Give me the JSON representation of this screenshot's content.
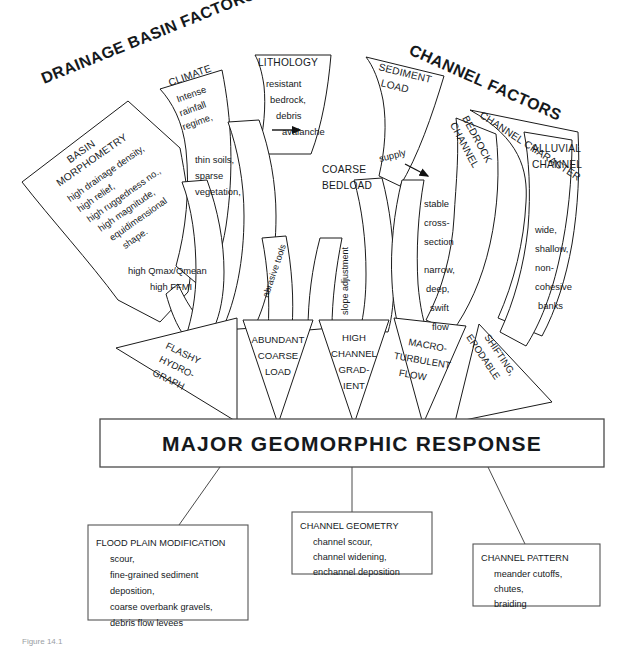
{
  "figure": {
    "caption": "Figure 14.1",
    "main_response_label": "MAJOR  GEOMORPHIC  RESPONSE"
  },
  "banners": [
    {
      "id": "drainage",
      "label": "DRAINAGE BASIN FACTORS"
    },
    {
      "id": "channel",
      "label": "CHANNEL FACTORS"
    }
  ],
  "factor_panels": [
    {
      "id": "basin-morphometry",
      "title_lines": [
        "BASIN",
        "MORPHOMETRY"
      ],
      "body_lines": [
        "high drainage density,",
        "high relief,",
        "high ruggedness no.,",
        "high magnitude,",
        "equidimensional",
        "shape."
      ],
      "output_lines": [
        "high Qmax/Qmean",
        "high FFMI"
      ]
    },
    {
      "id": "climate",
      "title_lines": [
        "CLIMATE"
      ],
      "body_lines": [
        "Intense",
        "rainfall",
        "regime,"
      ],
      "output_lines": [
        "thin soils,",
        "sparse",
        "vegetation,"
      ]
    },
    {
      "id": "lithology",
      "title_lines": [
        "LITHOLOGY"
      ],
      "body_lines": [
        "resistant",
        "bedrock,",
        "debris",
        "avalanche"
      ],
      "output_lines": [
        "COARSE",
        "BEDLOAD"
      ]
    },
    {
      "id": "sediment-load",
      "title_lines": [
        "SEDIMENT",
        "LOAD"
      ],
      "body_lines": [],
      "output_lines": [
        "supply"
      ]
    },
    {
      "id": "channel-character",
      "title_lines": [
        "CHANNEL CHARACTER"
      ],
      "body_lines": [],
      "output_lines": []
    },
    {
      "id": "bedrock-channel",
      "title_lines": [
        "BEDROCK",
        "CHANNEL"
      ],
      "body_lines": [
        "stable",
        "cross-",
        "section"
      ],
      "output_lines": [
        "narrow,",
        "deep,",
        "swift",
        "flow"
      ]
    },
    {
      "id": "alluvial-channel",
      "title_lines": [
        "ALLUVIAL",
        "CHANNEL"
      ],
      "body_lines": [
        "wide,",
        "shallow,",
        "non-",
        "cohesive",
        "banks"
      ],
      "output_lines": []
    }
  ],
  "process_labels": [
    {
      "id": "abrasive-tools",
      "label": "abrasive tools"
    },
    {
      "id": "slope-adjustment",
      "label": "slope adjustment"
    },
    {
      "id": "supply",
      "label": "supply"
    }
  ],
  "funnels": [
    {
      "id": "flashy-hydrograph",
      "lines": [
        "FLASHY",
        "HYDRO-",
        "GRAPH"
      ]
    },
    {
      "id": "abundant-coarse-load",
      "lines": [
        "ABUNDANT",
        "COARSE",
        "LOAD"
      ]
    },
    {
      "id": "high-channel-gradient",
      "lines": [
        "HIGH",
        "CHANNEL",
        "GRAD-",
        "IENT"
      ]
    },
    {
      "id": "macroturbulent-flow",
      "lines": [
        "MACRO-",
        "TURBULENT",
        "FLOW"
      ]
    },
    {
      "id": "shifting-erodable",
      "lines": [
        "SHIFTING,",
        "ERODABLE"
      ]
    }
  ],
  "response_boxes": [
    {
      "id": "flood-plain-modification",
      "title": "FLOOD PLAIN MODIFICATION",
      "items": [
        "scour,",
        "fine-grained sediment",
        "deposition,",
        "coarse overbank gravels,",
        "debris flow levees"
      ]
    },
    {
      "id": "channel-geometry",
      "title": "CHANNEL GEOMETRY",
      "items": [
        "channel scour,",
        "channel widening,",
        "enchannel deposition"
      ]
    },
    {
      "id": "channel-pattern",
      "title": "CHANNEL PATTERN",
      "items": [
        "meander cutoffs,",
        "chutes,",
        "braiding"
      ]
    }
  ],
  "colors": {
    "stroke": "#1a1a1a",
    "connector": "#4a4a4a",
    "text": "#15191c",
    "background": "#ffffff"
  }
}
